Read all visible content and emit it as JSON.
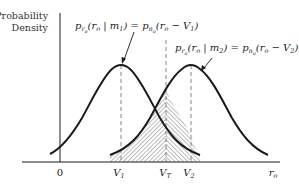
{
  "diagram": {
    "type": "probability-density-plot",
    "y_axis_label_line1": "Probability",
    "y_axis_label_line2": "Density",
    "x_axis_label": "r",
    "x_axis_label_sub": "o",
    "tick_labels": {
      "origin": "0",
      "v1": "V",
      "v1_sub": "1",
      "vt": "V",
      "vt_sub": "T",
      "v2": "V",
      "v2_sub": "2"
    },
    "annotations": {
      "curve1": {
        "p": "p",
        "p_sub": "r",
        "p_subsub": "o",
        "arg_open": "(r",
        "arg_o": "o",
        "given": " | m",
        "given_sub": "1",
        "eq": ") = p",
        "rhs_sub": "n",
        "rhs_subsub": "o",
        "rhs_arg": "(r",
        "rhs_o": "o",
        "rhs_tail": " − V",
        "rhs_tail_sub": "1",
        "close": ")"
      },
      "curve2": {
        "p": "p",
        "p_sub": "r",
        "p_subsub": "o",
        "arg_open": "(r",
        "arg_o": "o",
        "given": " | m",
        "given_sub": "2",
        "eq": ") = p",
        "rhs_sub": "n",
        "rhs_subsub": "o",
        "rhs_arg": "(r",
        "rhs_o": "o",
        "rhs_tail": " − V",
        "rhs_tail_sub": "2",
        "close": ")"
      }
    },
    "colors": {
      "curve": "#1a1a1a",
      "axis": "#1a1a1a",
      "dashed": "#666666",
      "hatch": "#555555"
    }
  }
}
